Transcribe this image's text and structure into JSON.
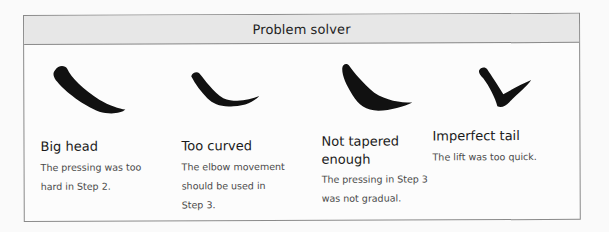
{
  "panel": {
    "title": "Problem solver"
  },
  "items": [
    {
      "stroke_icon": "brush-stroke-big-head",
      "title": "Big head",
      "body_lines": [
        "The pressing was too",
        "hard in Step 2."
      ]
    },
    {
      "stroke_icon": "brush-stroke-too-curved",
      "title": "Too curved",
      "body_lines": [
        "The elbow movement",
        "should be used in",
        "Step 3."
      ]
    },
    {
      "stroke_icon": "brush-stroke-not-tapered",
      "title_lines": [
        "Not tapered",
        "enough"
      ],
      "title": "Not tapered enough",
      "body_lines": [
        "The pressing in Step 3",
        "was not gradual."
      ]
    },
    {
      "stroke_icon": "brush-stroke-imperfect-tail",
      "title": "Imperfect tail",
      "body_lines": [
        "The lift was too quick."
      ]
    }
  ]
}
